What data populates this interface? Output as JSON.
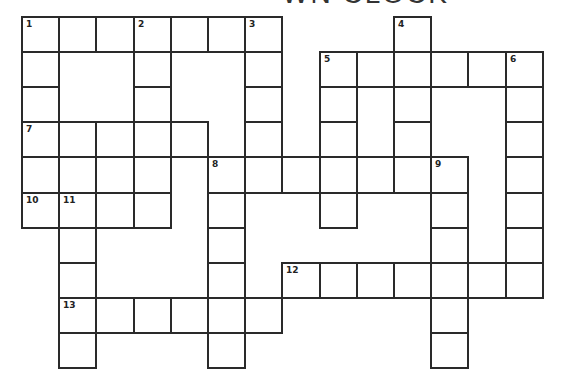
{
  "title_fragment": "WN CLOCK",
  "grid": {
    "origin_x": 22,
    "origin_y": 17,
    "col_width": 37.2,
    "row_height": 35.1,
    "cols": 14,
    "rows": 10,
    "line_color": "#2a2a2a"
  },
  "clue_numbers": [
    {
      "n": "1",
      "row": 0,
      "col": 0
    },
    {
      "n": "2",
      "row": 0,
      "col": 3
    },
    {
      "n": "3",
      "row": 0,
      "col": 6
    },
    {
      "n": "4",
      "row": 0,
      "col": 10
    },
    {
      "n": "5",
      "row": 1,
      "col": 8
    },
    {
      "n": "6",
      "row": 1,
      "col": 13
    },
    {
      "n": "7",
      "row": 3,
      "col": 0
    },
    {
      "n": "8",
      "row": 4,
      "col": 5
    },
    {
      "n": "9",
      "row": 4,
      "col": 11
    },
    {
      "n": "10",
      "row": 5,
      "col": 0
    },
    {
      "n": "11",
      "row": 5,
      "col": 1
    },
    {
      "n": "12",
      "row": 7,
      "col": 7
    },
    {
      "n": "13",
      "row": 8,
      "col": 1
    }
  ],
  "entries": [
    {
      "id": "1-across",
      "row": 0,
      "col": 0,
      "dir": "across",
      "length": 7
    },
    {
      "id": "1-down",
      "row": 0,
      "col": 0,
      "dir": "down",
      "length": 6
    },
    {
      "id": "2-down",
      "row": 0,
      "col": 3,
      "dir": "down",
      "length": 6
    },
    {
      "id": "3-down",
      "row": 0,
      "col": 6,
      "dir": "down",
      "length": 5
    },
    {
      "id": "4-down",
      "row": 0,
      "col": 10,
      "dir": "down",
      "length": 5
    },
    {
      "id": "5-across",
      "row": 1,
      "col": 8,
      "dir": "across",
      "length": 6
    },
    {
      "id": "5-down",
      "row": 1,
      "col": 8,
      "dir": "down",
      "length": 5
    },
    {
      "id": "6-down",
      "row": 1,
      "col": 13,
      "dir": "down",
      "length": 7
    },
    {
      "id": "7-across",
      "row": 3,
      "col": 0,
      "dir": "across",
      "length": 5
    },
    {
      "id": "8-across",
      "row": 4,
      "col": 5,
      "dir": "across",
      "length": 7
    },
    {
      "id": "8-down",
      "row": 4,
      "col": 5,
      "dir": "down",
      "length": 6
    },
    {
      "id": "9-down",
      "row": 4,
      "col": 11,
      "dir": "down",
      "length": 6
    },
    {
      "id": "10-across",
      "row": 5,
      "col": 0,
      "dir": "across",
      "length": 4
    },
    {
      "id": "11-down",
      "row": 5,
      "col": 1,
      "dir": "down",
      "length": 5
    },
    {
      "id": "12-across",
      "row": 7,
      "col": 7,
      "dir": "across",
      "length": 7
    },
    {
      "id": "13-across",
      "row": 8,
      "col": 1,
      "dir": "across",
      "length": 6
    }
  ],
  "extra_cells": [
    {
      "row": 4,
      "col": 1
    },
    {
      "row": 4,
      "col": 2
    }
  ]
}
